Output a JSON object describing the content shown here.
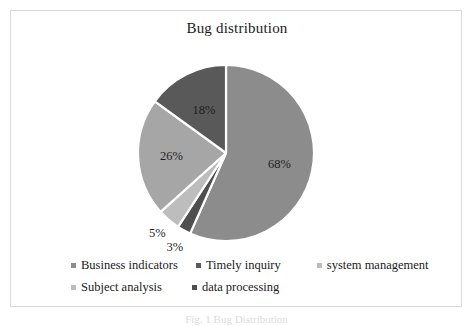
{
  "figure": {
    "title": "Bug distribution",
    "caption": "Fig. 1  Bug Distribution",
    "border_color": "#d9d9d9",
    "background": "#ffffff"
  },
  "chart_data": {
    "type": "pie",
    "title": "Bug distribution",
    "xlabel": "",
    "ylabel": "",
    "legend_position": "bottom",
    "grid": false,
    "start_angle_deg": 0,
    "direction": "clockwise",
    "categories": [
      "Business indicators",
      "Timely inquiry",
      "system management",
      "Subject analysis",
      "data processing"
    ],
    "values": [
      68,
      3,
      5,
      26,
      18
    ],
    "value_labels": [
      "68%",
      "3%",
      "5%",
      "26%",
      "18%"
    ],
    "colors": [
      "#8c8c8c",
      "#4f4f4f",
      "#bdbdbd",
      "#a6a6a6",
      "#595959"
    ],
    "slices": [
      {
        "label": "Business indicators",
        "value": 68,
        "display": "68%",
        "color": "#8c8c8c"
      },
      {
        "label": "Timely inquiry",
        "value": 3,
        "display": "3%",
        "color": "#4f4f4f"
      },
      {
        "label": "system management",
        "value": 5,
        "display": "5%",
        "color": "#bdbdbd"
      },
      {
        "label": "Subject analysis",
        "value": 26,
        "display": "26%",
        "color": "#a6a6a6"
      },
      {
        "label": "data processing",
        "value": 18,
        "display": "18%",
        "color": "#595959"
      }
    ],
    "separator_color": "#ffffff"
  },
  "legend": {
    "rows": [
      [
        {
          "label": "Business indicators",
          "color": "#8c8c8c"
        },
        {
          "label": "Timely inquiry",
          "color": "#595959"
        },
        {
          "label": "system management",
          "color": "#bdbdbd"
        }
      ],
      [
        {
          "label": "Subject analysis",
          "color": "#bdbdbd"
        },
        {
          "label": "data processing",
          "color": "#4f4f4f"
        }
      ]
    ]
  }
}
